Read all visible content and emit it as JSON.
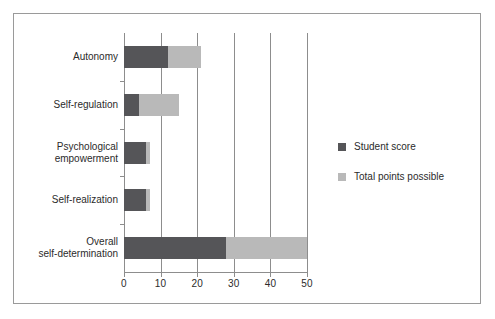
{
  "chart_data": {
    "type": "bar",
    "orientation": "horizontal",
    "stacked": true,
    "title": "",
    "xlabel": "",
    "ylabel": "",
    "xlim": [
      0,
      50
    ],
    "xticks": [
      0,
      10,
      20,
      30,
      40,
      50
    ],
    "xticklabels": [
      "0",
      "10",
      "20",
      "30",
      "40",
      "50"
    ],
    "grid": true,
    "grid_axis": "x",
    "legend_position": "right",
    "categories": [
      "Autonomy",
      "Self-regulation",
      "Psychological empowerment",
      "Self-realization",
      "Overall self-determination"
    ],
    "category_lines": [
      [
        "Autonomy"
      ],
      [
        "Self-regulation"
      ],
      [
        "Psychological",
        "empowerment"
      ],
      [
        "Self-realization"
      ],
      [
        "Overall",
        "self-determination"
      ]
    ],
    "series": [
      {
        "name": "Student score",
        "color": "#555558",
        "values": [
          12,
          4,
          6,
          6,
          28
        ]
      },
      {
        "name": "Total points possible",
        "color": "#b9b9b9",
        "values": [
          21,
          15,
          7,
          7,
          50
        ]
      }
    ]
  },
  "legend": {
    "items": [
      {
        "label": "Student score",
        "swatch": "dark"
      },
      {
        "label": "Total points possible",
        "swatch": "light"
      }
    ]
  },
  "colors": {
    "dark": "#555558",
    "light": "#b9b9b9",
    "axis": "#8d8d8d",
    "border": "#9a9a9a",
    "text": "#2b2b2b",
    "background": "#ffffff"
  }
}
